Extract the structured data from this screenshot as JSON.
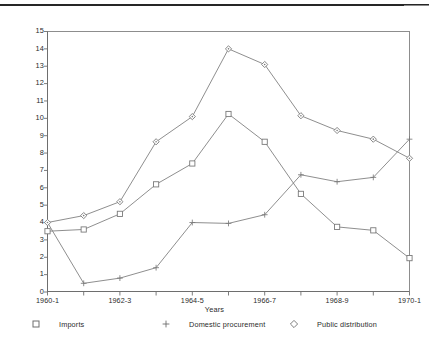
{
  "chart_data": {
    "type": "line",
    "title": "",
    "xlabel": "Years",
    "ylabel": "",
    "ylim": [
      0,
      15
    ],
    "ytick_labels": [
      "0",
      "1",
      "2",
      "3",
      "4",
      "5",
      "6",
      "7",
      "8",
      "9",
      "10",
      "11",
      "12",
      "13",
      "14",
      "15"
    ],
    "grid": false,
    "legend_position": "bottom",
    "categories": [
      "1960-1",
      "1961-2",
      "1962-3",
      "1963-4",
      "1964-5",
      "1965-6",
      "1966-7",
      "1967-8",
      "1968-9",
      "1969-70",
      "1970-1"
    ],
    "xtick_labels_shown": [
      "1960-1",
      "1962-3",
      "1964-5",
      "1966-7",
      "1968-9",
      "1970-1"
    ],
    "series": [
      {
        "name": "Imports",
        "marker": "square",
        "values": [
          3.5,
          3.6,
          4.5,
          6.2,
          7.4,
          10.25,
          8.65,
          5.65,
          3.75,
          3.55,
          1.95
        ]
      },
      {
        "name": "Domestic procurement",
        "marker": "plus",
        "values": [
          4.0,
          0.5,
          0.8,
          1.4,
          4.0,
          3.95,
          4.45,
          6.75,
          6.35,
          6.6,
          8.8
        ]
      },
      {
        "name": "Public distribution",
        "marker": "diamond",
        "values": [
          4.0,
          4.4,
          5.2,
          8.65,
          10.1,
          14.0,
          13.1,
          10.15,
          9.3,
          8.8,
          7.7
        ]
      }
    ],
    "imports_zero_anchor": [
      0.5,
      0.5,
      0.8,
      1.4,
      4.0,
      3.95,
      4.45,
      6.75,
      6.35,
      6.6,
      8.8
    ]
  },
  "legend": {
    "items": [
      {
        "label": "Imports",
        "marker": "square-marker-icon"
      },
      {
        "label": "Domestic procurement",
        "marker": "plus-marker-icon"
      },
      {
        "label": "Public distribution",
        "marker": "diamond-marker-icon"
      }
    ]
  }
}
